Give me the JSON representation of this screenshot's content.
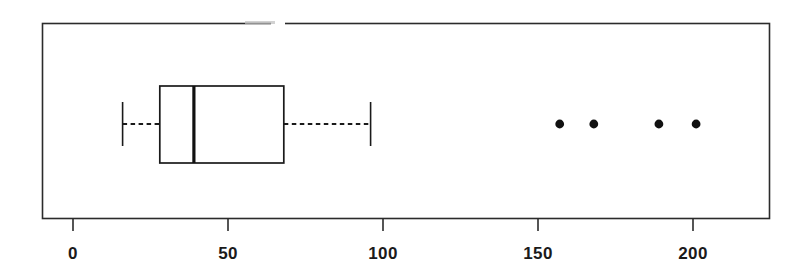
{
  "chart_data": {
    "type": "box",
    "orientation": "horizontal",
    "title": "",
    "subtitle": "",
    "xlabel": "",
    "ylabel": "",
    "xlim": [
      -8,
      227
    ],
    "xticks": [
      0,
      50,
      100,
      150,
      200
    ],
    "xtick_labels": [
      "0",
      "50",
      "100",
      "150",
      "200"
    ],
    "grid": false,
    "legend": null,
    "frame": "full-box",
    "series": [
      {
        "name": "distribution",
        "whisker_low": 16,
        "q1": 28,
        "median": 39,
        "q3": 68,
        "whisker_high": 96,
        "outliers": [
          157,
          168,
          189,
          201
        ],
        "whisker_style": "dashed",
        "median_style": "thick-solid",
        "box_fill": "none",
        "box_edge_color": "#1a1a1a",
        "outlier_marker": "filled-circle"
      }
    ]
  },
  "axis": {
    "tick_0": "0",
    "tick_50": "50",
    "tick_100": "100",
    "tick_150": "150",
    "tick_200": "200"
  },
  "colors": {
    "ink": "#1a1a1a",
    "line": "#2b2b2b",
    "background": "#ffffff"
  }
}
